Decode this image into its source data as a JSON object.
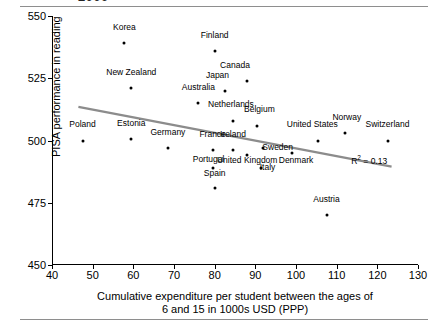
{
  "figure": {
    "top_title_partial": "2009",
    "r2_label": "R² = 0.13",
    "r2_prefix": "R",
    "r2_sup": "2",
    "r2_value": " = 0.13",
    "line_color": "#8c8c8c",
    "marker_color": "#000000"
  },
  "chart_data": {
    "type": "scatter",
    "title": "2009",
    "xlabel": "Cumulative expenditure per student between the ages of 6 and 15 in 1000s USD (PPP)",
    "xlabel_line1": "Cumulative expenditure per student between the ages of",
    "xlabel_line2": "6 and 15 in 1000s USD (PPP)",
    "ylabel": "PISA performance in reading",
    "xlim": [
      40,
      130
    ],
    "ylim": [
      450,
      550
    ],
    "xticks": [
      40,
      50,
      60,
      70,
      80,
      90,
      100,
      110,
      120,
      130
    ],
    "yticks": [
      450,
      475,
      500,
      525,
      550
    ],
    "grid": false,
    "legend": null,
    "annotations": [
      {
        "text": "R² = 0.13",
        "x": 118,
        "y": 492
      }
    ],
    "trendline": {
      "type": "linear",
      "r2": 0.13,
      "x_start": 46.5,
      "y_start": 513.5,
      "x_end": 123.5,
      "y_end": 489.5,
      "color": "#8c8c8c"
    },
    "points": [
      {
        "label": "Korea",
        "x": 57.8,
        "y": 539.0,
        "lx": 57.8,
        "ly": 545.5
      },
      {
        "label": "Finland",
        "x": 80.0,
        "y": 536.0,
        "lx": 80.0,
        "ly": 542.5
      },
      {
        "label": "Canada",
        "x": 88.0,
        "y": 524.0,
        "lx": 85.0,
        "ly": 530.5
      },
      {
        "label": "New Zealand",
        "x": 59.5,
        "y": 521.0,
        "lx": 59.5,
        "ly": 527.5
      },
      {
        "label": "Japan",
        "x": 82.5,
        "y": 520.0,
        "lx": 80.7,
        "ly": 526.5
      },
      {
        "label": "Australia",
        "x": 76.0,
        "y": 515.0,
        "lx": 76.0,
        "ly": 521.5
      },
      {
        "label": "Netherlands",
        "x": 84.5,
        "y": 508.0,
        "lx": 84.0,
        "ly": 514.5
      },
      {
        "label": "Belgium",
        "x": 90.5,
        "y": 506.0,
        "lx": 91.0,
        "ly": 512.5
      },
      {
        "label": "Norway",
        "x": 112.0,
        "y": 503.0,
        "lx": 112.5,
        "ly": 509.5
      },
      {
        "label": "United States",
        "x": 105.5,
        "y": 500.0,
        "lx": 104.0,
        "ly": 506.5
      },
      {
        "label": "Switzerland",
        "x": 122.5,
        "y": 500.0,
        "lx": 122.5,
        "ly": 506.5
      },
      {
        "label": "Estonia",
        "x": 59.5,
        "y": 500.5,
        "lx": 59.5,
        "ly": 507.0
      },
      {
        "label": "Poland",
        "x": 47.5,
        "y": 500.0,
        "lx": 47.5,
        "ly": 506.5
      },
      {
        "label": "Germany",
        "x": 68.5,
        "y": 497.0,
        "lx": 68.5,
        "ly": 503.5
      },
      {
        "label": "France",
        "x": 79.5,
        "y": 496.0,
        "lx": 79.5,
        "ly": 502.5
      },
      {
        "label": "Ireland",
        "x": 84.5,
        "y": 496.0,
        "lx": 84.5,
        "ly": 502.5
      },
      {
        "label": "Sweden",
        "x": 92.0,
        "y": 497.0,
        "lx": 95.5,
        "ly": 497.5
      },
      {
        "label": "Denmark",
        "x": 99.0,
        "y": 495.0,
        "lx": 100.0,
        "ly": 492.0
      },
      {
        "label": "United Kingdom",
        "x": 88.0,
        "y": 494.0,
        "lx": 88.0,
        "ly": 492.0
      },
      {
        "label": "Portugal",
        "x": 79.5,
        "y": 489.0,
        "lx": 78.5,
        "ly": 492.5
      },
      {
        "label": "Italy",
        "x": 91.5,
        "y": 489.0,
        "lx": 93.0,
        "ly": 489.5
      },
      {
        "label": "Spain",
        "x": 80.0,
        "y": 481.0,
        "lx": 80.0,
        "ly": 487.0
      },
      {
        "label": "Austria",
        "x": 107.5,
        "y": 470.0,
        "lx": 107.5,
        "ly": 476.5
      }
    ]
  }
}
